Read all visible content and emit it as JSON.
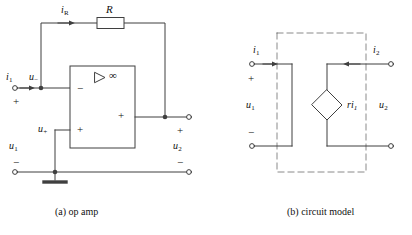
{
  "figure": {
    "background_color": "#ffffff",
    "line_color": "#3f3f3f",
    "text_color": "#111111",
    "width": 412,
    "height": 235
  },
  "panel_a": {
    "caption": "(a) op amp",
    "labels": {
      "i_R": "i",
      "i_R_sub": "R",
      "resistor": "R",
      "i_1": "i",
      "i_1_sub": "1",
      "u_minus": "u",
      "u_minus_sub": "−",
      "u_plus": "u",
      "u_plus_sub": "+",
      "u_1": "u",
      "u_1_sub": "1",
      "u_2": "u",
      "u_2_sub": "2",
      "infinity": "∞",
      "opamp_inverting_sign": "−",
      "opamp_noninverting_sign": "+",
      "opamp_output_sign": "+",
      "input_plus": "+",
      "input_minus": "−",
      "output_plus": "+",
      "output_minus": "−"
    }
  },
  "panel_b": {
    "caption": "(b) circuit model",
    "labels": {
      "i_1": "i",
      "i_1_sub": "1",
      "i_2": "i",
      "i_2_sub": "2",
      "u_1": "u",
      "u_1_sub": "1",
      "u_2": "u",
      "u_2_sub": "2",
      "source": "ri",
      "source_sub": "1",
      "input_plus": "+",
      "input_minus": "−"
    }
  }
}
